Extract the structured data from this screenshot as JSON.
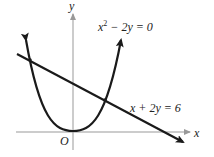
{
  "diagram": {
    "axes": {
      "x_label": "x",
      "y_label": "y",
      "origin_label": "O"
    },
    "curves": [
      {
        "name": "parabola",
        "equation": "x² − 2y = 0",
        "eq_base": "x",
        "eq_sup": "2",
        "eq_rest": " − 2y = 0"
      },
      {
        "name": "line",
        "equation": "x + 2y = 6"
      }
    ],
    "intersections": [
      {
        "x": -3,
        "y": 4.5
      },
      {
        "x": 2,
        "y": 2
      }
    ],
    "colors": {
      "axis": "#999999",
      "curve": "#1a1a1a",
      "text": "#222222"
    }
  }
}
